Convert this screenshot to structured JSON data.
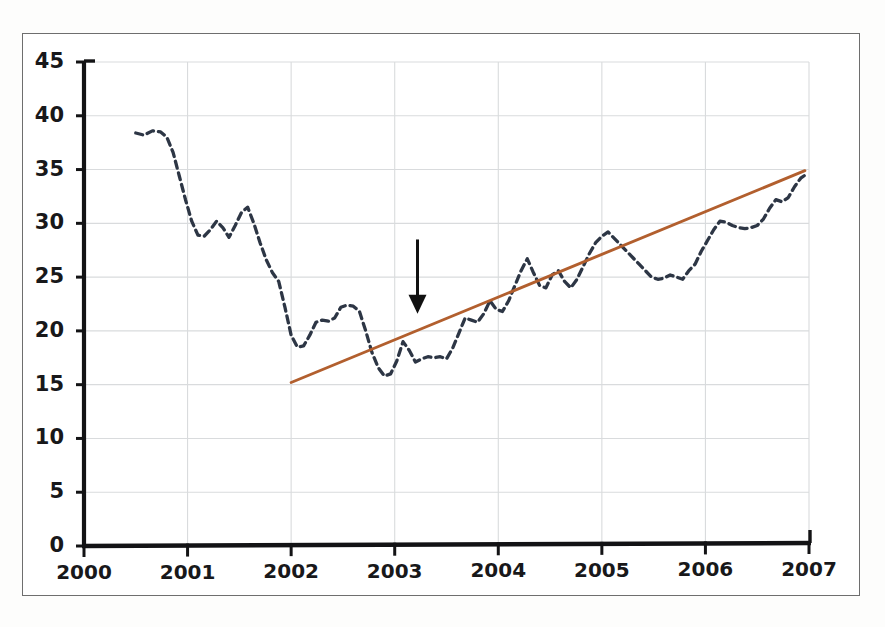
{
  "chart_data": {
    "type": "line",
    "title": "",
    "subtitle": "",
    "xlabel": "",
    "ylabel": "",
    "xlim": [
      2000,
      2007
    ],
    "ylim": [
      0,
      45
    ],
    "grid": true,
    "legend_position": "none",
    "y_ticks": [
      0,
      5,
      10,
      15,
      20,
      25,
      30,
      35,
      40,
      45
    ],
    "y_tick_labels": [
      "0",
      "5",
      "10",
      "15",
      "20",
      "25",
      "30",
      "35",
      "40",
      "45"
    ],
    "x_ticks": [
      2000,
      2001,
      2002,
      2003,
      2004,
      2005,
      2006,
      2007
    ],
    "x_tick_labels": [
      "2000",
      "2001",
      "2002",
      "2003",
      "2004",
      "2005",
      "2006",
      "2007"
    ],
    "series": [
      {
        "name": "observed-series",
        "style": "dashed",
        "color": "#2d3645",
        "x": [
          2000.5,
          2000.58,
          2000.66,
          2000.74,
          2000.8,
          2000.86,
          2000.92,
          2000.98,
          2001.04,
          2001.1,
          2001.16,
          2001.22,
          2001.28,
          2001.34,
          2001.4,
          2001.46,
          2001.52,
          2001.58,
          2001.64,
          2001.7,
          2001.76,
          2001.82,
          2001.88,
          2001.94,
          2002.0,
          2002.06,
          2002.12,
          2002.18,
          2002.24,
          2002.3,
          2002.36,
          2002.42,
          2002.48,
          2002.54,
          2002.6,
          2002.66,
          2002.72,
          2002.78,
          2002.84,
          2002.9,
          2002.96,
          2003.02,
          2003.08,
          2003.14,
          2003.2,
          2003.26,
          2003.32,
          2003.38,
          2003.44,
          2003.5,
          2003.56,
          2003.62,
          2003.68,
          2003.74,
          2003.8,
          2003.86,
          2003.92,
          2003.98,
          2004.04,
          2004.1,
          2004.16,
          2004.22,
          2004.28,
          2004.34,
          2004.4,
          2004.46,
          2004.52,
          2004.58,
          2004.64,
          2004.7,
          2004.76,
          2004.82,
          2004.88,
          2004.94,
          2005.0,
          2005.06,
          2005.12,
          2005.18,
          2005.24,
          2005.3,
          2005.36,
          2005.42,
          2005.48,
          2005.54,
          2005.6,
          2005.66,
          2005.72,
          2005.78,
          2005.84,
          2005.9,
          2005.96,
          2006.02,
          2006.08,
          2006.14,
          2006.2,
          2006.26,
          2006.32,
          2006.38,
          2006.44,
          2006.5,
          2006.56,
          2006.62,
          2006.68,
          2006.74,
          2006.8,
          2006.86,
          2006.92,
          2006.98
        ],
        "values": [
          38.4,
          38.2,
          38.6,
          38.5,
          38.0,
          36.6,
          34.4,
          32.2,
          30.2,
          28.9,
          28.8,
          29.4,
          30.2,
          29.6,
          28.7,
          29.8,
          31.0,
          31.5,
          30.0,
          28.2,
          26.6,
          25.4,
          24.6,
          22.2,
          19.6,
          18.5,
          18.6,
          19.6,
          20.8,
          21.0,
          20.9,
          21.2,
          22.2,
          22.4,
          22.3,
          21.8,
          20.0,
          18.0,
          16.6,
          15.8,
          16.0,
          17.2,
          19.0,
          18.2,
          17.1,
          17.4,
          17.6,
          17.5,
          17.6,
          17.4,
          18.4,
          19.8,
          21.2,
          21.0,
          20.8,
          21.6,
          22.8,
          22.0,
          21.8,
          22.8,
          24.2,
          25.6,
          26.7,
          25.4,
          24.2,
          24.0,
          25.2,
          25.6,
          24.6,
          24.0,
          24.8,
          26.0,
          27.2,
          28.2,
          28.8,
          29.2,
          28.6,
          28.0,
          27.4,
          26.8,
          26.2,
          25.6,
          25.0,
          24.8,
          24.9,
          25.2,
          25.0,
          24.8,
          25.6,
          26.2,
          27.4,
          28.4,
          29.4,
          30.2,
          30.1,
          29.8,
          29.6,
          29.5,
          29.6,
          29.8,
          30.4,
          31.4,
          32.2,
          32.0,
          32.4,
          33.4,
          34.2,
          34.6
        ]
      },
      {
        "name": "trend-line",
        "style": "solid",
        "color": "#b25f2e",
        "x": [
          2002.0,
          2006.96
        ],
        "values": [
          15.2,
          34.9
        ]
      }
    ],
    "annotations": [
      {
        "name": "down-arrow",
        "kind": "arrow",
        "direction": "down",
        "x": 2003.22,
        "y_from": 28.5,
        "y_to": 21.6,
        "color": "#111111",
        "label": ""
      }
    ]
  }
}
